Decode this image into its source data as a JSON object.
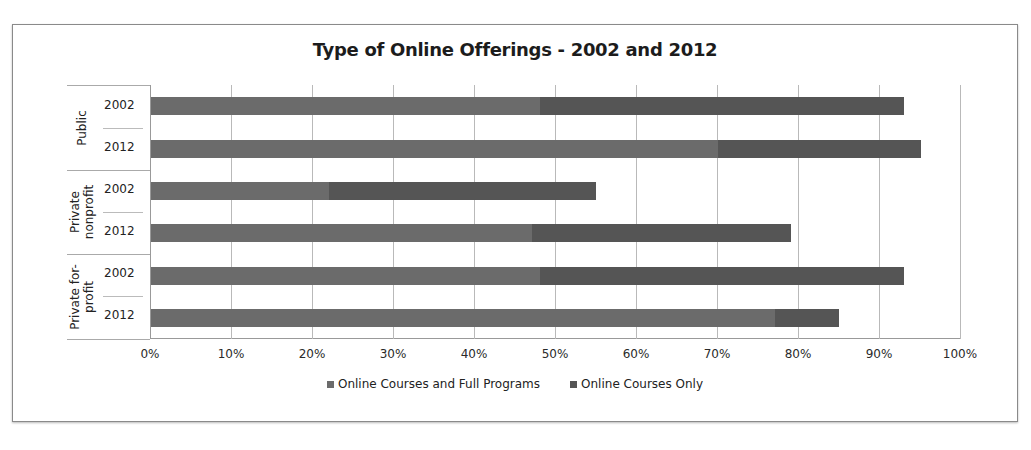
{
  "chart_data": {
    "type": "bar",
    "orientation": "horizontal",
    "stacked": true,
    "title": "Type of Online Offerings - 2002 and 2012",
    "xlabel": "",
    "ylabel": "",
    "xlim": [
      0,
      100
    ],
    "x_tick_labels": [
      "0%",
      "10%",
      "20%",
      "30%",
      "40%",
      "50%",
      "60%",
      "70%",
      "80%",
      "90%",
      "100%"
    ],
    "grid": true,
    "legend_position": "bottom",
    "groups": [
      {
        "label": "Public",
        "categories": [
          "2002",
          "2012"
        ]
      },
      {
        "label": "Private\nnonprofit",
        "categories": [
          "2002",
          "2012"
        ]
      },
      {
        "label": "Private for-\nprofit",
        "categories": [
          "2002",
          "2012"
        ]
      }
    ],
    "categories": [
      "Public 2002",
      "Public 2012",
      "Private nonprofit 2002",
      "Private nonprofit 2012",
      "Private for-profit 2002",
      "Private for-profit 2012"
    ],
    "series": [
      {
        "name": "Online Courses and Full Programs",
        "color": "#6b6b6b",
        "values": [
          48,
          70,
          22,
          47,
          48,
          77
        ]
      },
      {
        "name": "Online Courses Only",
        "color": "#555555",
        "values": [
          45,
          25,
          33,
          32,
          45,
          8
        ]
      }
    ]
  },
  "chart": {
    "title": "Type of Online Offerings - 2002 and 2012",
    "groups": [
      "Public",
      "Private\nnonprofit",
      "Private for-\nprofit"
    ],
    "years": [
      "2002",
      "2012",
      "2002",
      "2012",
      "2002",
      "2012"
    ],
    "ticks": [
      "0%",
      "10%",
      "20%",
      "30%",
      "40%",
      "50%",
      "60%",
      "70%",
      "80%",
      "90%",
      "100%"
    ],
    "legend": [
      "Online Courses and Full Programs",
      "Online Courses Only"
    ]
  }
}
